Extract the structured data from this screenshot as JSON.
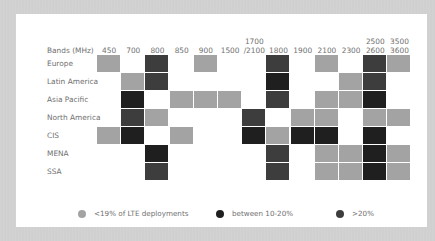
{
  "colors": {
    "low": "#a3a3a3",
    "mid": "#1f1f1f",
    "high": "#3d3d3d"
  },
  "chart_data": {
    "type": "heatmap",
    "title": "",
    "row_header": "Bands (MHz)",
    "columns": [
      "450",
      "700",
      "800",
      "850",
      "900",
      "1500",
      "1700 /2100",
      "1800",
      "1900",
      "2100",
      "2300",
      "2500 2600",
      "3500 3600"
    ],
    "rows": [
      "Europe",
      "Latin America",
      "Asia Pacific",
      "North America",
      "CIS",
      "MENA",
      "SSA"
    ],
    "legend": [
      {
        "key": "low",
        "label": "<19% of LTE deployments"
      },
      {
        "key": "mid",
        "label": "between 10-20%"
      },
      {
        "key": "high",
        "label": ">20%"
      }
    ],
    "cells": {
      "Europe": [
        "low",
        null,
        "high",
        null,
        "low",
        null,
        null,
        "high",
        null,
        "low",
        null,
        "high",
        "low"
      ],
      "Latin America": [
        null,
        "low",
        "high",
        null,
        null,
        null,
        null,
        "mid",
        null,
        null,
        "low",
        "high",
        null
      ],
      "Asia Pacific": [
        null,
        "mid",
        null,
        "low",
        "low",
        "low",
        null,
        "high",
        null,
        "low",
        "low",
        "mid",
        null
      ],
      "North America": [
        null,
        "high",
        "low",
        null,
        null,
        null,
        "high",
        null,
        "low",
        "low",
        null,
        "low",
        "low"
      ],
      "CIS": [
        "low",
        "mid",
        null,
        "low",
        null,
        null,
        "mid",
        "low",
        "mid",
        "mid",
        null,
        "mid",
        null
      ],
      "MENA": [
        null,
        null,
        "mid",
        null,
        null,
        null,
        null,
        "high",
        null,
        "low",
        "low",
        "mid",
        "low"
      ],
      "SSA": [
        null,
        null,
        "high",
        null,
        null,
        null,
        null,
        "high",
        null,
        "low",
        "low",
        "mid",
        "low"
      ]
    }
  },
  "header": {
    "title": "Bands (MHz)",
    "cols": [
      {
        "l1": "450",
        "l2": ""
      },
      {
        "l1": "700",
        "l2": ""
      },
      {
        "l1": "800",
        "l2": ""
      },
      {
        "l1": "850",
        "l2": ""
      },
      {
        "l1": "900",
        "l2": ""
      },
      {
        "l1": "1500",
        "l2": ""
      },
      {
        "l1": "1700",
        "l2": "/2100"
      },
      {
        "l1": "1800",
        "l2": ""
      },
      {
        "l1": "1900",
        "l2": ""
      },
      {
        "l1": "2100",
        "l2": ""
      },
      {
        "l1": "2300",
        "l2": ""
      },
      {
        "l1": "2500",
        "l2": "2600"
      },
      {
        "l1": "3500",
        "l2": "3600"
      }
    ]
  },
  "rows": [
    "Europe",
    "Latin America",
    "Asia Pacific",
    "North America",
    "CIS",
    "MENA",
    "SSA"
  ],
  "legend": {
    "low": "<19% of LTE deployments",
    "mid": "between 10-20%",
    "high": ">20%"
  }
}
